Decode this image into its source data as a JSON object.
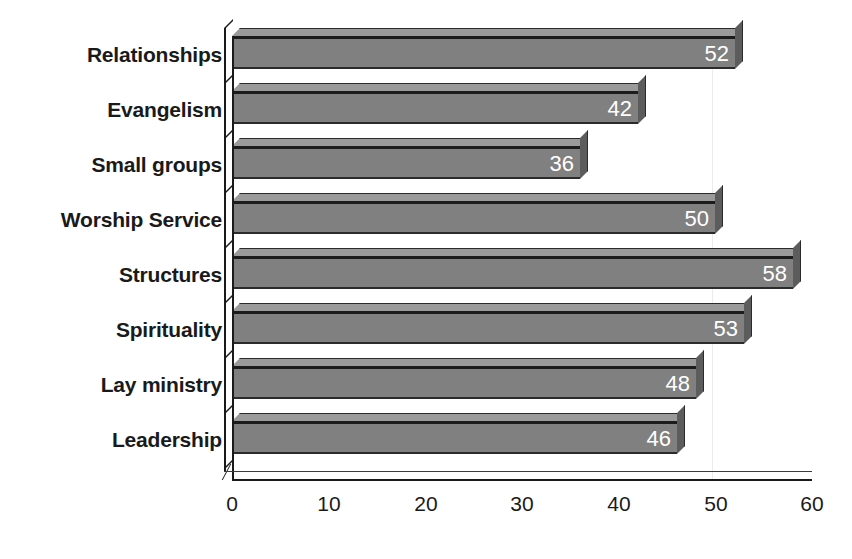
{
  "chart_data": {
    "type": "bar",
    "orientation": "horizontal",
    "title": "",
    "subtitle": "",
    "xlabel": "",
    "ylabel": "",
    "categories": [
      "Relationships",
      "Evangelism",
      "Small groups",
      "Worship Service",
      "Structures",
      "Spirituality",
      "Lay ministry",
      "Leadership"
    ],
    "values": [
      52,
      42,
      36,
      50,
      58,
      53,
      48,
      46
    ],
    "series": [
      {
        "name": "",
        "values": [
          52,
          42,
          36,
          50,
          58,
          53,
          48,
          46
        ]
      }
    ],
    "xlim": [
      0,
      60
    ],
    "xticks": [
      0,
      10,
      20,
      30,
      40,
      50,
      60
    ],
    "xtick_labels": [
      "0",
      "10",
      "20",
      "30",
      "40",
      "50",
      "60"
    ],
    "grid": "faint-vertical",
    "legend": "none",
    "style": "3d-horizontal-bar",
    "data_labels": [
      "52",
      "42",
      "36",
      "50",
      "58",
      "53",
      "48",
      "46"
    ],
    "colors": {
      "bar_front": "#808080",
      "bar_top": "#9a9a9a",
      "bar_side": "#5c5c5c",
      "bar_outline": "#1c1c1c",
      "data_label_text": "#ffffff",
      "category_label_text": "#1a1a1a",
      "axis": "#1a1a1a",
      "gridline": "#ececec",
      "background": "#ffffff"
    }
  }
}
